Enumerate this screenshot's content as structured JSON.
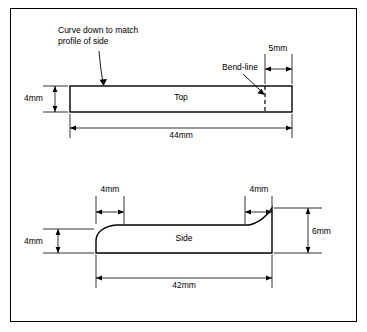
{
  "diagram": {
    "border_color": "#000000",
    "line_color": "#000000",
    "background": "#ffffff",
    "notes": [
      {
        "id": "curve-note",
        "text": "Curve down to match\nprofile of side"
      },
      {
        "id": "bend-line-note",
        "text": "Bend-line"
      }
    ],
    "top_view": {
      "name": "Top",
      "label": "Top",
      "dimensions": [
        {
          "id": "top-height",
          "value": "4mm",
          "orientation": "vertical",
          "position": "left"
        },
        {
          "id": "top-length",
          "value": "44mm",
          "orientation": "horizontal",
          "position": "below"
        },
        {
          "id": "bend-offset",
          "value": "5mm",
          "orientation": "horizontal",
          "position": "above-right"
        }
      ]
    },
    "side_view": {
      "name": "Side",
      "label": "Side",
      "dimensions": [
        {
          "id": "side-left-flat",
          "value": "4mm",
          "orientation": "horizontal",
          "position": "above-left"
        },
        {
          "id": "side-right-flat",
          "value": "4mm",
          "orientation": "horizontal",
          "position": "above-right"
        },
        {
          "id": "side-left-height",
          "value": "4mm",
          "orientation": "vertical",
          "position": "left"
        },
        {
          "id": "side-right-height",
          "value": "6mm",
          "orientation": "vertical",
          "position": "right"
        },
        {
          "id": "side-length",
          "value": "42mm",
          "orientation": "horizontal",
          "position": "below"
        }
      ]
    }
  }
}
